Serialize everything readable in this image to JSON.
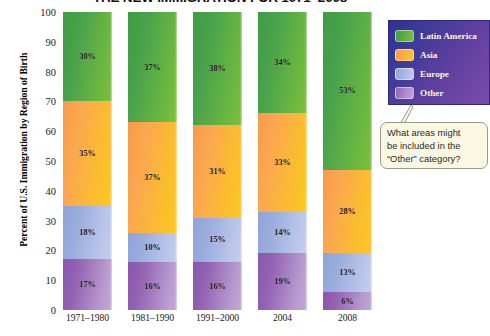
{
  "chart_data": {
    "type": "bar",
    "stacked": true,
    "title": "THE NEW IMMIGRATION FOR 1971–2008",
    "xlabel": "",
    "ylabel": "Percent of U.S. Immigration by Region of Birth",
    "ylim": [
      0,
      100
    ],
    "ytick_step": 10,
    "yticks": [
      "100",
      "90",
      "80",
      "70",
      "60",
      "50",
      "40",
      "30",
      "20",
      "10",
      "0"
    ],
    "grid": false,
    "legend_position": "right-top",
    "categories": [
      "1971–1980",
      "1981–1990",
      "1991–2000",
      "2004",
      "2008"
    ],
    "series": [
      {
        "name": "Latin America",
        "color": "#5fae42",
        "values": [
          30,
          37,
          38,
          34,
          53
        ],
        "labels": [
          "30%",
          "37%",
          "38%",
          "34%",
          "53%"
        ]
      },
      {
        "name": "Asia",
        "color": "#fbb13c",
        "values": [
          35,
          37,
          31,
          33,
          28
        ],
        "labels": [
          "35%",
          "37%",
          "31%",
          "33%",
          "28%"
        ]
      },
      {
        "name": "Europe",
        "color": "#aab8e4",
        "values": [
          18,
          10,
          15,
          14,
          13
        ],
        "labels": [
          "18%",
          "10%",
          "15%",
          "14%",
          "13%"
        ]
      },
      {
        "name": "Other",
        "color": "#ab82c6",
        "values": [
          17,
          16,
          16,
          19,
          6
        ],
        "labels": [
          "17%",
          "16%",
          "16%",
          "19%",
          "6%"
        ]
      }
    ],
    "annotations": [
      {
        "name": "other-category-question",
        "text_lines": [
          "What areas might",
          "be included in the",
          "“Other” category?"
        ]
      }
    ],
    "colors": {
      "legend_background_start": "#2f2f8f",
      "legend_background_end": "#7a4bab",
      "legend_text": "#fdf6d8",
      "callout_background": "#faf7e2",
      "callout_border": "#9a9a8c"
    }
  }
}
